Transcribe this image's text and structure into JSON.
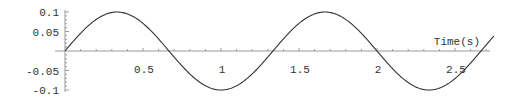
{
  "chart_data": {
    "type": "line",
    "title": "",
    "xlabel": "Time(s)",
    "ylabel": "",
    "xlim": [
      0,
      2.75
    ],
    "ylim": [
      -0.1,
      0.1
    ],
    "grid": false,
    "legend": null,
    "x_ticks": [
      "0.5",
      "1",
      "1.5",
      "2",
      "2.5"
    ],
    "y_ticks": [
      "0.1",
      "0.05",
      "-0.05",
      "-0.1"
    ],
    "series": [
      {
        "name": "signal",
        "function": "0.1*sin(1.5*pi*t)",
        "amplitude": 0.1,
        "period": 1.3333,
        "x": [
          0,
          0.1667,
          0.3333,
          0.5,
          0.6667,
          0.8333,
          1.0,
          1.1667,
          1.3333,
          1.5,
          1.6667,
          1.8333,
          2.0,
          2.1667,
          2.3333,
          2.5,
          2.6667,
          2.75
        ],
        "values": [
          0,
          0.0707,
          0.1,
          0.0707,
          0,
          -0.0707,
          -0.1,
          -0.0707,
          0,
          0.0707,
          0.1,
          0.0707,
          0,
          -0.0707,
          -0.1,
          -0.0707,
          0,
          0.0383
        ]
      }
    ]
  },
  "axes": {
    "x_label": "Time(s)",
    "x_tick_labels": [
      "0.5",
      "1",
      "1.5",
      "2",
      "2.5"
    ],
    "y_tick_labels": [
      "0.1",
      "0.05",
      "-0.05",
      "-0.1"
    ]
  },
  "colors": {
    "axis": "#999999",
    "curve": "#333333",
    "text": "#333333"
  }
}
